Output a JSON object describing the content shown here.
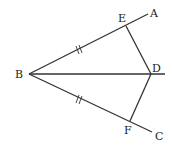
{
  "diagram": {
    "type": "geometry",
    "points": {
      "B": {
        "label": "B",
        "x": 29,
        "y": 74
      },
      "E": {
        "label": "E",
        "x": 126,
        "y": 26
      },
      "A": {
        "label": "A",
        "x": 148,
        "y": 13
      },
      "D": {
        "label": "D",
        "x": 151,
        "y": 74
      },
      "F": {
        "label": "F",
        "x": 130,
        "y": 121
      },
      "C": {
        "label": "C",
        "x": 152,
        "y": 131
      }
    },
    "segments": [
      "BA",
      "BC",
      "BD (ray)",
      "ED",
      "FD"
    ],
    "equal_marks": [
      "BE",
      "BF"
    ],
    "line_color": "#333333"
  }
}
